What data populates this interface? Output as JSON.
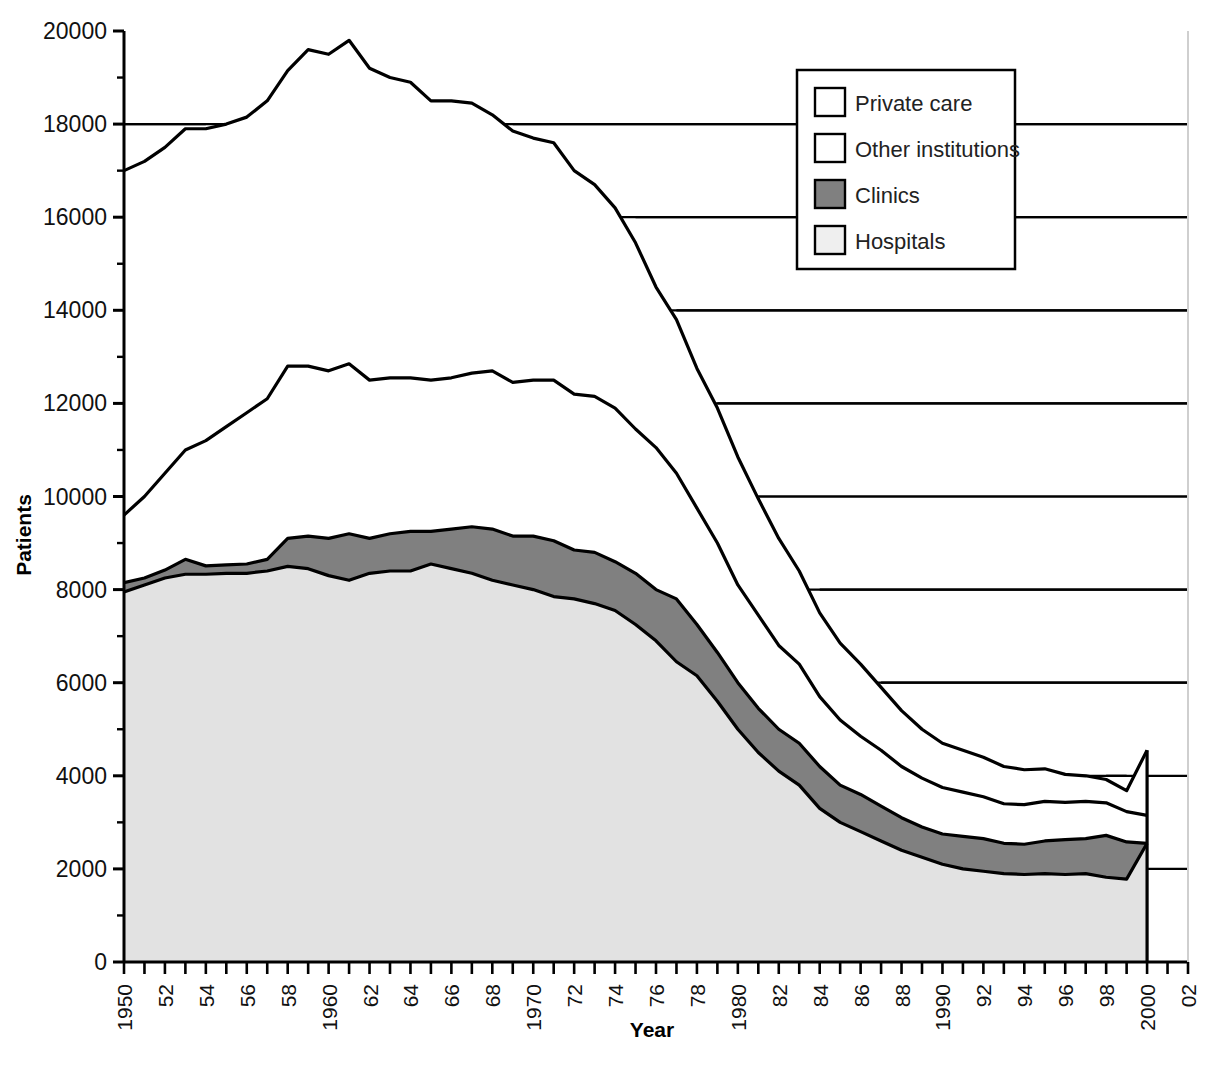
{
  "chart_data": {
    "type": "area",
    "stacked": true,
    "title": "",
    "xlabel": "Year",
    "ylabel": "Patients",
    "ylim": [
      0,
      20000
    ],
    "xlim": [
      1950,
      2002
    ],
    "ytick_values": [
      0,
      2000,
      4000,
      6000,
      8000,
      10000,
      12000,
      14000,
      16000,
      18000,
      20000
    ],
    "ytick_labels": [
      "0",
      "2000",
      "4000",
      "6000",
      "8000",
      "10000",
      "12000",
      "14000",
      "16000",
      "18000",
      "20000"
    ],
    "xtick_values": [
      1950,
      1951,
      1952,
      1953,
      1954,
      1955,
      1956,
      1957,
      1958,
      1959,
      1960,
      1961,
      1962,
      1963,
      1964,
      1965,
      1966,
      1967,
      1968,
      1969,
      1970,
      1971,
      1972,
      1973,
      1974,
      1975,
      1976,
      1977,
      1978,
      1979,
      1980,
      1981,
      1982,
      1983,
      1984,
      1985,
      1986,
      1987,
      1988,
      1989,
      1990,
      1991,
      1992,
      1993,
      1994,
      1995,
      1996,
      1997,
      1998,
      1999,
      2000,
      2001,
      2002
    ],
    "xtick_labels_shown": [
      "1950",
      "52",
      "54",
      "56",
      "58",
      "1960",
      "62",
      "64",
      "66",
      "68",
      "1970",
      "72",
      "74",
      "76",
      "78",
      "1980",
      "82",
      "84",
      "86",
      "88",
      "1990",
      "92",
      "94",
      "96",
      "98",
      "2000",
      "02"
    ],
    "xtick_label_years": [
      1950,
      1952,
      1954,
      1956,
      1958,
      1960,
      1962,
      1964,
      1966,
      1968,
      1970,
      1972,
      1974,
      1976,
      1978,
      1980,
      1982,
      1984,
      1986,
      1988,
      1990,
      1992,
      1994,
      1996,
      1998,
      2000,
      2002
    ],
    "xtick_label_rotation": -90,
    "grid": "horizontal-only-visible-over-unfilled-area",
    "legend_position": "top-right-inside",
    "x": [
      1950,
      1951,
      1952,
      1953,
      1954,
      1955,
      1956,
      1957,
      1958,
      1959,
      1960,
      1961,
      1962,
      1963,
      1964,
      1965,
      1966,
      1967,
      1968,
      1969,
      1970,
      1971,
      1972,
      1973,
      1974,
      1975,
      1976,
      1977,
      1978,
      1979,
      1980,
      1981,
      1982,
      1983,
      1984,
      1985,
      1986,
      1987,
      1988,
      1989,
      1990,
      1991,
      1992,
      1993,
      1994,
      1995,
      1996,
      1997,
      1998,
      1999,
      2000
    ],
    "series": [
      {
        "name": "Hospitals",
        "color": "#e2e2e2",
        "edge_color": "#000000",
        "stack_order": 1,
        "values": [
          7950,
          8100,
          8250,
          8330,
          8330,
          8350,
          8350,
          8400,
          8500,
          8450,
          8300,
          8200,
          8350,
          8400,
          8400,
          8550,
          8450,
          8350,
          8200,
          8100,
          8000,
          7850,
          7800,
          7700,
          7550,
          7250,
          6900,
          6450,
          6150,
          5600,
          5000,
          4500,
          4100,
          3800,
          3300,
          3000,
          2800,
          2600,
          2400,
          2250,
          2100,
          2000,
          1950,
          1900,
          1880,
          1900,
          1880,
          1900,
          1820,
          1780,
          2550
        ]
      },
      {
        "name": "Clinics",
        "color": "#808080",
        "edge_color": "#000000",
        "stack_order": 2,
        "values": [
          200,
          150,
          170,
          320,
          180,
          180,
          200,
          250,
          600,
          700,
          800,
          1000,
          750,
          800,
          850,
          700,
          850,
          1000,
          1100,
          1050,
          1150,
          1200,
          1050,
          1100,
          1050,
          1100,
          1100,
          1350,
          1100,
          1050,
          1000,
          950,
          900,
          900,
          900,
          800,
          800,
          750,
          700,
          650,
          650,
          700,
          700,
          650,
          650,
          700,
          750,
          750,
          900,
          800,
          0
        ]
      },
      {
        "name": "Other institutions",
        "color": "#ffffff",
        "edge_color": "#000000",
        "stack_order": 3,
        "values": [
          1450,
          1750,
          2080,
          2350,
          2690,
          2970,
          3250,
          3450,
          3700,
          3650,
          3600,
          3650,
          3400,
          3350,
          3300,
          3250,
          3250,
          3300,
          3400,
          3300,
          3350,
          3450,
          3350,
          3350,
          3300,
          3100,
          3050,
          2700,
          2500,
          2350,
          2100,
          2000,
          1800,
          1700,
          1500,
          1400,
          1250,
          1200,
          1100,
          1050,
          1000,
          950,
          900,
          850,
          850,
          850,
          800,
          800,
          700,
          650,
          600
        ]
      },
      {
        "name": "Private care",
        "color": "#ffffff",
        "edge_color": "#000000",
        "stack_order": 4,
        "values": [
          7400,
          7200,
          7000,
          6900,
          6700,
          6500,
          6350,
          6400,
          6350,
          6800,
          6800,
          6950,
          6700,
          6450,
          6350,
          6000,
          5950,
          5800,
          5500,
          5400,
          5200,
          5100,
          4800,
          4550,
          4300,
          4000,
          3450,
          3300,
          3000,
          2900,
          2750,
          2500,
          2300,
          2000,
          1800,
          1650,
          1550,
          1350,
          1200,
          1050,
          950,
          900,
          850,
          800,
          750,
          700,
          600,
          550,
          500,
          450,
          1400
        ]
      }
    ],
    "total_top_values": [
      17000,
      17200,
      17500,
      17900,
      17900,
      18000,
      18150,
      18500,
      19150,
      19600,
      19500,
      19800,
      19200,
      19000,
      18900,
      18500,
      18500,
      18450,
      18200,
      17850,
      17700,
      17600,
      17000,
      16700,
      16200,
      15450,
      14500,
      13800,
      12750,
      11900,
      10850,
      9950,
      9100,
      8400,
      7500,
      6850,
      6400,
      5900,
      5400,
      5000,
      4700,
      4550,
      4400,
      4200,
      4130,
      4150,
      4030,
      4000,
      3920,
      3680,
      4550
    ]
  },
  "legend": {
    "items": [
      {
        "label": "Private care",
        "swatch_color": "#ffffff"
      },
      {
        "label": "Other institutions",
        "swatch_color": "#ffffff"
      },
      {
        "label": "Clinics",
        "swatch_color": "#808080"
      },
      {
        "label": "Hospitals",
        "swatch_color": "#efefef"
      }
    ]
  },
  "axis": {
    "ylabel": "Patients",
    "xlabel": "Year"
  },
  "caption": {
    "text": ""
  }
}
